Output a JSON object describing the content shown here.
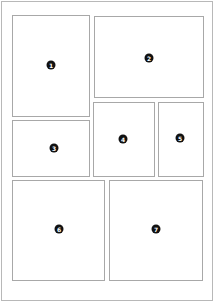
{
  "layout": {
    "title": "Comic page panel layout",
    "panels": [
      {
        "number": "1",
        "label": "1"
      },
      {
        "number": "2",
        "label": "2"
      },
      {
        "number": "3",
        "label": "3"
      },
      {
        "number": "4",
        "label": "4"
      },
      {
        "number": "5",
        "label": "5"
      },
      {
        "number": "6",
        "label": "6"
      },
      {
        "number": "7",
        "label": "7"
      }
    ]
  },
  "colors": {
    "border": "#a8a8a8",
    "badge": "#111111",
    "background": "#ffffff"
  }
}
